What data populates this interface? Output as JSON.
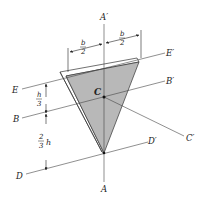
{
  "figure": {
    "type": "triangular-plate-axes-diagram",
    "colors": {
      "plate_fill": "#b8b8b8",
      "plate_edge": "#ffffff",
      "outline": "#333333",
      "axis_line": "#555555"
    },
    "axes": {
      "A_label": "A",
      "A_prime_label": "A′",
      "B_label": "B",
      "B_prime_label": "B′",
      "C_label": "C′",
      "D_label": "D",
      "D_prime_label": "D′",
      "E_label": "E",
      "E_prime_label": "E′"
    },
    "centroid_label": "C",
    "dimensions": {
      "half_base_left_num": "b",
      "half_base_left_den": "2",
      "half_base_right_num": "b",
      "half_base_right_den": "2",
      "top_height_num": "h",
      "top_height_den": "3",
      "bottom_height_num": "2",
      "bottom_height_den": "3",
      "bottom_height_var": "h"
    }
  }
}
